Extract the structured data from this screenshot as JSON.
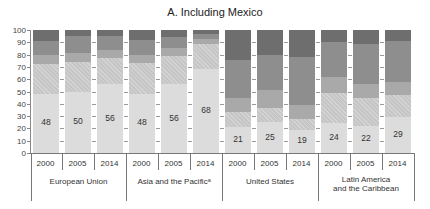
{
  "chart_data": {
    "type": "bar",
    "stacked": true,
    "title": "A. Including Mexico",
    "xlabel": "",
    "ylabel": "",
    "ylim": [
      0,
      100
    ],
    "yticks": [
      0,
      10,
      20,
      30,
      40,
      50,
      60,
      70,
      80,
      90,
      100
    ],
    "grid": false,
    "legend": "none",
    "groups": [
      {
        "label": "European Union",
        "categories": [
          "2000",
          "2005",
          "2014"
        ]
      },
      {
        "label": "Asia and the Pacificᵃ",
        "categories": [
          "2000",
          "2005",
          "2014"
        ]
      },
      {
        "label": "United States",
        "categories": [
          "2000",
          "2005",
          "2014"
        ]
      },
      {
        "label": "Latin America and the Caribbean",
        "categories": [
          "2000",
          "2005",
          "2014"
        ]
      }
    ],
    "categories": [
      "European Union 2000",
      "European Union 2005",
      "European Union 2014",
      "Asia and the Pacific 2000",
      "Asia and the Pacific 2005",
      "Asia and the Pacific 2014",
      "United States 2000",
      "United States 2005",
      "United States 2014",
      "Latin America and the Caribbean 2000",
      "Latin America and the Caribbean 2005",
      "Latin America and the Caribbean 2014"
    ],
    "series": [
      {
        "name": "segment-1 (bottom, labeled)",
        "color": "#dcdcdc",
        "values": [
          48,
          50,
          56,
          48,
          56,
          68,
          21,
          25,
          19,
          24,
          22,
          29
        ]
      },
      {
        "name": "segment-2 (hatched)",
        "color": "#c6c6c6",
        "values": [
          24,
          24,
          21,
          25,
          23,
          21,
          12,
          12,
          9,
          25,
          23,
          18
        ]
      },
      {
        "name": "segment-3",
        "color": "#a9a9a9",
        "values": [
          8,
          7,
          7,
          7,
          6,
          4,
          12,
          14,
          11,
          13,
          11,
          11
        ]
      },
      {
        "name": "segment-4",
        "color": "#8e8e8e",
        "values": [
          11,
          14,
          11,
          12,
          9,
          4,
          31,
          29,
          39,
          28,
          33,
          33
        ]
      },
      {
        "name": "segment-5 (top)",
        "color": "#6e6e6e",
        "values": [
          9,
          5,
          5,
          8,
          6,
          3,
          24,
          20,
          22,
          10,
          11,
          9
        ]
      }
    ],
    "data_labels": [
      48,
      50,
      56,
      48,
      56,
      68,
      21,
      25,
      19,
      24,
      22,
      29
    ]
  },
  "title": "A. Including Mexico",
  "yaxis": {
    "ticks": [
      "0",
      "10",
      "20",
      "30",
      "40",
      "50",
      "60",
      "70",
      "80",
      "90",
      "100"
    ]
  },
  "years": [
    "2000",
    "2005",
    "2014",
    "2000",
    "2005",
    "2014",
    "2000",
    "2005",
    "2014",
    "2000",
    "2005",
    "2014"
  ],
  "group_labels": {
    "eu": "European Union",
    "asia": "Asia and the Pacificᵃ",
    "us": "United States",
    "latam_line1": "Latin America",
    "latam_line2": "and the Caribbean"
  },
  "bar_labels": [
    "48",
    "50",
    "56",
    "48",
    "56",
    "68",
    "21",
    "25",
    "19",
    "24",
    "22",
    "29"
  ]
}
